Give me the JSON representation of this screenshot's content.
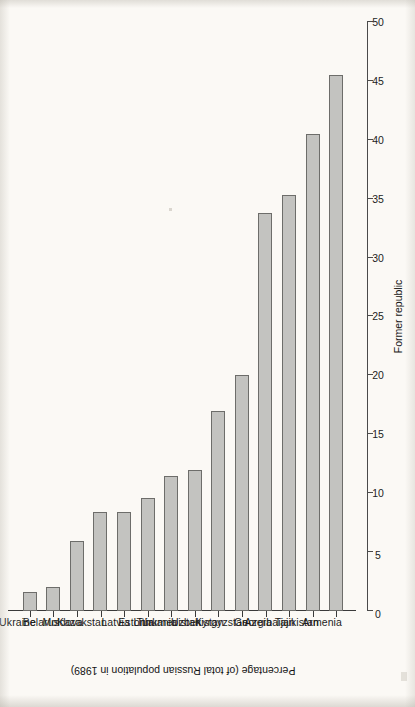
{
  "chart_data": {
    "type": "bar",
    "title": "",
    "orientation": "vertical-bars-on-rotated-page",
    "xlabel": "Former republic",
    "ylabel": "Percentage (of total Russian population in 1989)",
    "ylim": [
      0,
      50
    ],
    "yticks": [
      0,
      5,
      10,
      15,
      20,
      25,
      30,
      35,
      40,
      45,
      50
    ],
    "ytick_labels": [
      "0",
      "5",
      "10",
      "15",
      "20",
      "25",
      "30",
      "35",
      "40",
      "45",
      "50"
    ],
    "grid": false,
    "legend": null,
    "bar_color": "#c3c3c0",
    "bar_edge_color": "#6d6d6a",
    "categories": [
      "Ukraine",
      "Belarus",
      "Moldova",
      "Kazakstan",
      "Latvia",
      "Estonia",
      "Lithuania",
      "Turkmenistan",
      "Uzbekistan",
      "Kyrgyzstan",
      "Georgia",
      "Azerbaijan",
      "Tajikistan",
      "Armenia"
    ],
    "values": [
      1.6,
      2.0,
      5.9,
      8.4,
      8.4,
      9.6,
      11.5,
      12.0,
      17.0,
      20.0,
      33.8,
      35.3,
      40.5,
      45.5
    ]
  }
}
